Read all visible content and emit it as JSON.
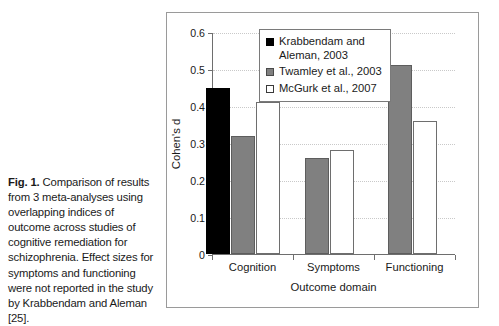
{
  "caption": {
    "fig_label": "Fig. 1.",
    "text": " Comparison of results from 3 meta-analyses using overlapping indices of outcome across studies of cognitive remediation for schizophrenia. Effect sizes for symptoms and functioning were not reported in the study by Krabbendam and Aleman [25]."
  },
  "chart_data": {
    "type": "bar",
    "title": "",
    "xlabel": "Outcome domain",
    "ylabel": "Cohen's d",
    "categories": [
      "Cognition",
      "Symptoms",
      "Functioning"
    ],
    "series": [
      {
        "name": "Krabbendam and Aleman, 2003",
        "color": "#000000",
        "style": "black",
        "values": [
          0.45,
          null,
          null
        ]
      },
      {
        "name": "Twamley et al., 2003",
        "color": "#808080",
        "style": "gray",
        "values": [
          0.32,
          0.26,
          0.51
        ]
      },
      {
        "name": "McGurk et al., 2007",
        "color": "#ffffff",
        "style": "white",
        "values": [
          0.41,
          0.28,
          0.36
        ]
      }
    ],
    "ylim": [
      0,
      0.6
    ],
    "ytick_labels": [
      "0",
      "0.1",
      "0.2",
      "0.3",
      "0.4",
      "0.5",
      "0.6"
    ],
    "ytick_values": [
      0,
      0.1,
      0.2,
      0.3,
      0.4,
      0.5,
      0.6
    ],
    "grid": true,
    "legend_position": "top-center",
    "legend_entries": [
      "Krabbendam and\nAleman, 2003",
      "Twamley et al., 2003",
      "McGurk et al., 2007"
    ]
  }
}
